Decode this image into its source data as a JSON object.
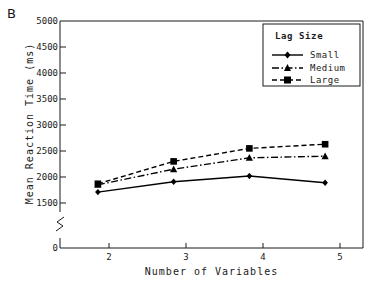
{
  "figure": {
    "panel_label": "B",
    "background_color": "#ffffff",
    "axis_color": "#1a1a1a"
  },
  "chart_data": {
    "type": "line",
    "title": "",
    "xlabel": "Number of Variables",
    "ylabel": "Mean Reaction Time (ms)",
    "x": [
      2,
      3,
      4,
      5
    ],
    "categories": [
      "2",
      "3",
      "4",
      "5"
    ],
    "xlim": [
      1.5,
      5.5
    ],
    "ylim": [
      1400,
      5000
    ],
    "yticks": [
      0,
      1500,
      2000,
      2500,
      3000,
      3500,
      4000,
      4500,
      5000
    ],
    "ytick_labels": [
      "0",
      "1500",
      "2000",
      "2500",
      "3000",
      "3500",
      "4000",
      "4500",
      "5000"
    ],
    "xtick_labels": [
      "2",
      "3",
      "4",
      "5"
    ],
    "axis_break": true,
    "axis_break_note": "y-axis broken between 0 and 1500",
    "grid": false,
    "legend_position": "top-right",
    "legend_title": "Lag Size",
    "series": [
      {
        "name": "Small",
        "values": [
          1710,
          1910,
          2020,
          1890
        ],
        "line_style": "solid",
        "marker": "diamond",
        "color": "#000000"
      },
      {
        "name": "Medium",
        "values": [
          1850,
          2150,
          2370,
          2400
        ],
        "line_style": "dash-dot",
        "marker": "triangle",
        "color": "#000000"
      },
      {
        "name": "Large",
        "values": [
          1870,
          2300,
          2550,
          2630
        ],
        "line_style": "dashed",
        "marker": "square",
        "color": "#000000"
      }
    ]
  }
}
